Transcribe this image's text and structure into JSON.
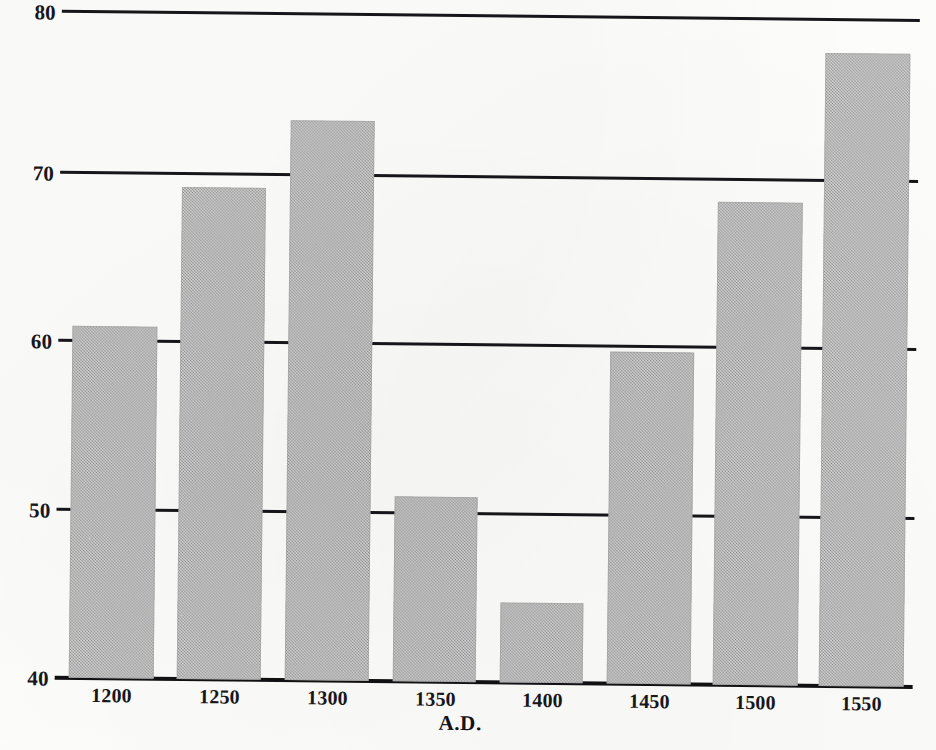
{
  "chart_data": {
    "type": "bar",
    "title": "",
    "subtitle": "",
    "xlabel": "A.D.",
    "ylabel": "",
    "categories": [
      "1200",
      "1250",
      "1300",
      "1350",
      "1400",
      "1450",
      "1500",
      "1550"
    ],
    "values": [
      60.8,
      69.3,
      73.4,
      51.1,
      44.9,
      59.8,
      69.2,
      78.1
    ],
    "ylim": [
      40,
      80
    ],
    "yticks": [
      40,
      50,
      60,
      70,
      80
    ],
    "ytick_labels": [
      "40",
      "50",
      "60",
      "70",
      "80"
    ],
    "xtick_labels": [
      "1200",
      "1250",
      "1300",
      "1350",
      "1400",
      "1450",
      "1500",
      "1550"
    ],
    "grid": true,
    "grid_axis": "y",
    "legend": false,
    "legend_position": "none",
    "bar_color": "#a9a9a9",
    "axis_color": "#16161a",
    "annotations": []
  },
  "axes": {
    "y_labels": [
      {
        "value": "80",
        "y_px": 2
      },
      {
        "value": "70",
        "y_px": 163
      },
      {
        "value": "60",
        "y_px": 331
      },
      {
        "value": "50",
        "y_px": 500
      },
      {
        "value": "40",
        "y_px": 668
      }
    ],
    "x_labels": [
      {
        "value": "1200",
        "x_px": 76,
        "width_px": 86
      },
      {
        "value": "1250",
        "x_px": 184,
        "width_px": 86
      },
      {
        "value": "1300",
        "x_px": 292,
        "width_px": 86
      },
      {
        "value": "1350",
        "x_px": 400,
        "width_px": 86
      },
      {
        "value": "1400",
        "x_px": 507,
        "width_px": 86
      },
      {
        "value": "1450",
        "x_px": 614,
        "width_px": 86
      },
      {
        "value": "1500",
        "x_px": 720,
        "width_px": 86
      },
      {
        "value": "1550",
        "x_px": 826,
        "width_px": 86
      }
    ],
    "x_title": "A.D."
  },
  "gridlines": [
    {
      "label": "80",
      "y_px": 9
    },
    {
      "label": "70",
      "y_px": 170
    },
    {
      "label": "60",
      "y_px": 338
    },
    {
      "label": "50",
      "y_px": 507
    },
    {
      "label": "40",
      "y_px": 675
    }
  ],
  "bars": [
    {
      "category": "1200",
      "value": 60.8,
      "x_px": 76,
      "width_px": 85,
      "top_px": 325,
      "height_px": 352
    },
    {
      "category": "1250",
      "value": 69.3,
      "x_px": 184,
      "width_px": 84,
      "top_px": 185,
      "height_px": 492
    },
    {
      "category": "1300",
      "value": 73.4,
      "x_px": 292,
      "width_px": 84,
      "top_px": 117,
      "height_px": 560
    },
    {
      "category": "1350",
      "value": 51.1,
      "x_px": 400,
      "width_px": 83,
      "top_px": 492,
      "height_px": 185
    },
    {
      "category": "1400",
      "value": 44.9,
      "x_px": 507,
      "width_px": 83,
      "top_px": 597,
      "height_px": 80
    },
    {
      "category": "1450",
      "value": 59.8,
      "x_px": 614,
      "width_px": 84,
      "top_px": 345,
      "height_px": 332
    },
    {
      "category": "1500",
      "value": 69.2,
      "x_px": 720,
      "width_px": 85,
      "top_px": 194,
      "height_px": 483
    },
    {
      "category": "1550",
      "value": 78.1,
      "x_px": 826,
      "width_px": 85,
      "top_px": 44,
      "height_px": 633
    }
  ]
}
